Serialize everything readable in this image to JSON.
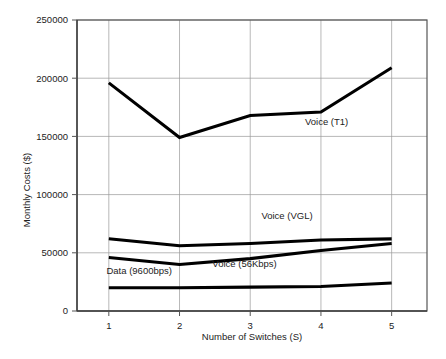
{
  "chart_data": {
    "type": "line",
    "title": "",
    "xlabel": "Number of Switches (S)",
    "ylabel": "Monthly Costs ($)",
    "x": [
      1,
      2,
      3,
      4,
      5
    ],
    "categories": [
      "1",
      "2",
      "3",
      "4",
      "5"
    ],
    "xtick_labels": [
      "1",
      "2",
      "3",
      "4",
      "5"
    ],
    "ytick_labels": [
      "0",
      "50000",
      "100000",
      "150000",
      "200000",
      "250000"
    ],
    "ytick_values": [
      0,
      50000,
      100000,
      150000,
      200000,
      250000
    ],
    "xlim": [
      0.55,
      5.5
    ],
    "ylim": [
      0,
      250000
    ],
    "grid": true,
    "legend_position": "inline-annotations",
    "series": [
      {
        "name": "Voice (T1)",
        "label": "Voice (T1)",
        "values": [
          196000,
          149000,
          168000,
          171000,
          209000
        ],
        "color": "#000000",
        "label_x": 4.08,
        "label_y": 160000
      },
      {
        "name": "Voice (VGL)",
        "label": "Voice (VGL)",
        "values": [
          62000,
          56000,
          58000,
          61000,
          62000
        ],
        "color": "#000000",
        "label_x": 3.52,
        "label_y": 79000
      },
      {
        "name": "Voice (56Kbps)",
        "label": "Voice (56Kbps)",
        "values": [
          46000,
          40000,
          45000,
          52000,
          58000
        ],
        "color": "#000000",
        "label_x": 2.92,
        "label_y": 38000
      },
      {
        "name": "Data (9600bps)",
        "label": "Data (9600bps)",
        "values": [
          20000,
          20000,
          20500,
          21000,
          24000
        ],
        "color": "#000000",
        "label_x": 1.43,
        "label_y": 31500
      }
    ]
  },
  "figure": {
    "background": "#ffffff",
    "axis_color": "#3c3c3c",
    "grid_color": "#9a9a9a",
    "line_color": "#000000"
  }
}
